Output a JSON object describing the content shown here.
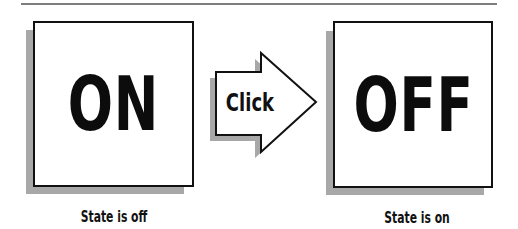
{
  "figure": {
    "left_panel": {
      "label": "ON",
      "caption": "State is off"
    },
    "action": {
      "label": "Click",
      "icon": "right-arrow-icon"
    },
    "right_panel": {
      "label": "OFF",
      "caption": "State is on"
    }
  },
  "colors": {
    "border": "#111111",
    "shadow": "#a8a8a8",
    "rule": "#7d7d7d",
    "background": "#ffffff"
  }
}
